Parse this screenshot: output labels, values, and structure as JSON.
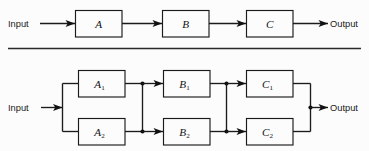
{
  "figure": {
    "background_color": "#fcfcfc",
    "line_color": "#1b1b1b",
    "divider": {
      "name": "horizontal-rule"
    }
  },
  "diagrams": [
    {
      "id": "series",
      "input_label": "Input",
      "output_label": "Output",
      "blocks": [
        {
          "id": "A",
          "letter": "A",
          "subscript": ""
        },
        {
          "id": "B",
          "letter": "B",
          "subscript": ""
        },
        {
          "id": "C",
          "letter": "C",
          "subscript": ""
        }
      ]
    },
    {
      "id": "parallel-redundant",
      "input_label": "Input",
      "output_label": "Output",
      "blocks": [
        {
          "id": "A1",
          "letter": "A",
          "subscript": "1"
        },
        {
          "id": "A2",
          "letter": "A",
          "subscript": "2"
        },
        {
          "id": "B1",
          "letter": "B",
          "subscript": "1"
        },
        {
          "id": "B2",
          "letter": "B",
          "subscript": "2"
        },
        {
          "id": "C1",
          "letter": "C",
          "subscript": "1"
        },
        {
          "id": "C2",
          "letter": "C",
          "subscript": "2"
        }
      ]
    }
  ]
}
